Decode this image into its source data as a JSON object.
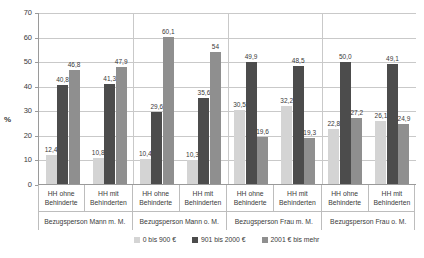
{
  "chart_data": {
    "type": "bar",
    "title": "",
    "subtitle": "",
    "xlabel": "",
    "ylabel": "%",
    "ylim": [
      0,
      70
    ],
    "ytick_step": 10,
    "yticks": [
      "70",
      "60",
      "50",
      "40",
      "30",
      "20",
      "10",
      "0"
    ],
    "grid": true,
    "legend_position": "bottom-center",
    "categories": [
      "HH ohne Behinderte",
      "HH mit Behinderten",
      "HH ohne Behinderte",
      "HH mit Behinderten",
      "HH ohne Behinderte",
      "HH mit Behinderten",
      "HH ohne Behinderte",
      "HH mit Behinderten"
    ],
    "category_lines": [
      [
        "HH ohne",
        "Behinderte"
      ],
      [
        "HH mit",
        "Behinderten"
      ],
      [
        "HH ohne",
        "Behinderte"
      ],
      [
        "HH mit",
        "Behinderten"
      ],
      [
        "HH ohne",
        "Behinderte"
      ],
      [
        "HH mit",
        "Behinderten"
      ],
      [
        "HH ohne",
        "Behinderte"
      ],
      [
        "HH mit",
        "Behinderten"
      ]
    ],
    "super_categories": [
      "Bezugsperson Mann m. M.",
      "Bezugsperson Mann o. M.",
      "Bezugsperson Frau m. M.",
      "Bezugsperson Frau o. M."
    ],
    "series": [
      {
        "name": "0 bis 900 €",
        "color": "#d4d4d4",
        "values": [
          12.4,
          10.8,
          10.4,
          10.3,
          30.5,
          32.2,
          22.8,
          26.1
        ],
        "labels": [
          "12,4",
          "10,8",
          "10,4",
          "10,3",
          "30,5",
          "32,2",
          "22,8",
          "26,1"
        ]
      },
      {
        "name": "901 bis 2000 €",
        "color": "#4c4c4c",
        "values": [
          40.8,
          41.3,
          29.6,
          35.6,
          49.9,
          48.5,
          50.0,
          49.1
        ],
        "labels": [
          "40,8",
          "41,3",
          "29,6",
          "35,6",
          "49,9",
          "48,5",
          "50,0",
          "49,1"
        ]
      },
      {
        "name": "2001 € bis mehr",
        "color": "#8f8f8f",
        "values": [
          46.8,
          47.9,
          60.1,
          54.0,
          19.6,
          19.3,
          27.2,
          24.9
        ],
        "labels": [
          "46,8",
          "47,9",
          "60,1",
          "54",
          "19,6",
          "19,3",
          "27,2",
          "24,9"
        ]
      }
    ]
  },
  "axis": {
    "y_title": "%"
  },
  "legend": {
    "items": [
      {
        "label": "0 bis 900 €",
        "color": "#d4d4d4"
      },
      {
        "label": "901 bis 2000 €",
        "color": "#4c4c4c"
      },
      {
        "label": "2001 € bis mehr",
        "color": "#8f8f8f"
      }
    ]
  },
  "colors": {
    "gridline": "#c9c9c9",
    "axis": "#9a9a9a",
    "text": "#3a3a3a",
    "background": "#ffffff"
  }
}
